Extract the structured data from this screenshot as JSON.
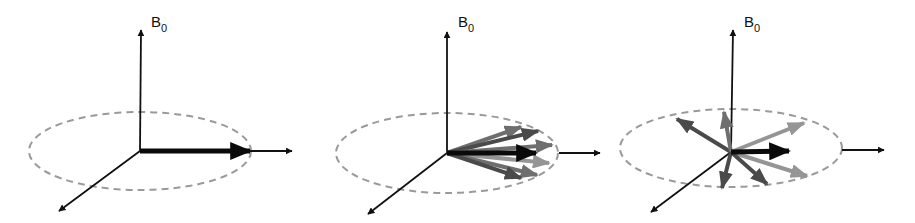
{
  "figure": {
    "axis_label": "B",
    "axis_label_subscript": "0",
    "colors": {
      "axis": "#111111",
      "ellipse": "#9a9a9a",
      "net_vector": "#0a0a0a",
      "spin_dark": "#4a4a4a",
      "spin_mid": "#6e6e6e",
      "spin_light": "#959595"
    },
    "panels": [
      {
        "id": "in-phase",
        "label_main": "B",
        "label_sub": "0",
        "spin_count": 1
      },
      {
        "id": "partially-dephased",
        "label_main": "B",
        "label_sub": "0",
        "spin_count": 7
      },
      {
        "id": "dephased",
        "label_main": "B",
        "label_sub": "0",
        "spin_count": 7
      }
    ]
  }
}
